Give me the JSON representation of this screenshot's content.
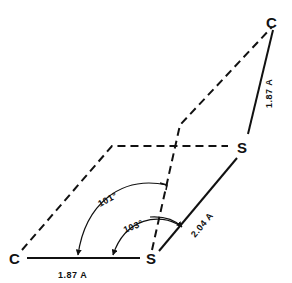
{
  "diagram": {
    "type": "vector phasor diagram",
    "nodes": {
      "c_left": "C",
      "s_bottom": "S",
      "s_right": "S",
      "c_top": "C"
    },
    "labels": {
      "bottom_magnitude": "1.87 A",
      "diagonal_magnitude": "2.04 A",
      "right_magnitude": "1.87 A",
      "angle_outer": "101°",
      "angle_inner": "103°"
    },
    "colors": {
      "line": "#111111",
      "background": "#ffffff"
    }
  }
}
